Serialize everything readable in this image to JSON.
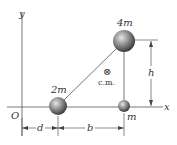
{
  "diagram": {
    "axes": {
      "x_label": "x",
      "y_label": "y",
      "origin_label": "O"
    },
    "masses": [
      {
        "id": "mass-2m",
        "label": "2m",
        "cx": 58,
        "cy": 106,
        "r": 9
      },
      {
        "id": "mass-m",
        "label": "m",
        "cx": 124,
        "cy": 106,
        "r": 6
      },
      {
        "id": "mass-4m",
        "label": "4m",
        "cx": 124,
        "cy": 41,
        "r": 11
      }
    ],
    "center_of_mass": {
      "symbol": "⊗",
      "label": "c.m."
    },
    "dimensions": {
      "d_label": "d",
      "b_label": "b",
      "h_label": "h"
    },
    "colors": {
      "line": "#555555",
      "ball_light": "#d8d8d8",
      "ball_dark": "#4a4a4a",
      "text": "#333333"
    }
  }
}
